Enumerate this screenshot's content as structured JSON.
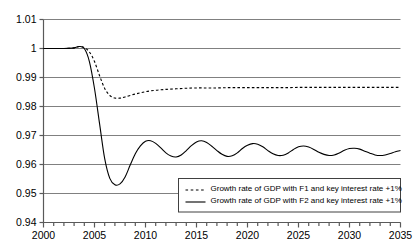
{
  "chart_data": {
    "type": "line",
    "title": "",
    "xlabel": "",
    "ylabel": "",
    "xlim": [
      2000,
      2035
    ],
    "ylim": [
      0.94,
      1.01
    ],
    "grid": true,
    "legend_position": "inside-bottom-right",
    "y_ticks": [
      "1.01",
      "1",
      "0.99",
      "0.98",
      "0.97",
      "0.96",
      "0.95",
      "0.94"
    ],
    "y_tick_values": [
      1.01,
      1.0,
      0.99,
      0.98,
      0.97,
      0.96,
      0.95,
      0.94
    ],
    "x_ticks": [
      "2000",
      "2005",
      "2010",
      "2015",
      "2020",
      "2025",
      "2030",
      "2035"
    ],
    "x_tick_values": [
      2000,
      2005,
      2010,
      2015,
      2020,
      2025,
      2030,
      2035
    ],
    "x_minor_tick_step": 1,
    "series": [
      {
        "name": "Growth rate of GDP with F1 and key interest rate +1%",
        "style": "dashed",
        "color": "#000000",
        "x": [
          2000,
          2001,
          2002,
          2003,
          2003.5,
          2004,
          2004.5,
          2005,
          2005.5,
          2006,
          2006.5,
          2007,
          2007.5,
          2008,
          2009,
          2010,
          2011,
          2012,
          2013,
          2014,
          2015,
          2016,
          2017,
          2018,
          2019,
          2020,
          2021,
          2022,
          2023,
          2024,
          2025,
          2026,
          2027,
          2028,
          2029,
          2030,
          2031,
          2032,
          2033,
          2034,
          2035
        ],
        "values": [
          1.0,
          1.0,
          1.0,
          1.0002,
          1.0007,
          1.0003,
          0.9988,
          0.9955,
          0.9906,
          0.9862,
          0.9838,
          0.9829,
          0.9829,
          0.9833,
          0.9843,
          0.9851,
          0.9856,
          0.9859,
          0.9861,
          0.9863,
          0.9864,
          0.9864,
          0.9864,
          0.9865,
          0.9865,
          0.9865,
          0.9865,
          0.9865,
          0.9865,
          0.9865,
          0.9866,
          0.9866,
          0.9866,
          0.9866,
          0.9866,
          0.9866,
          0.9866,
          0.9866,
          0.9866,
          0.9866,
          0.9866
        ]
      },
      {
        "name": "Growth rate of GDP with F2 and key interest rate +1%",
        "style": "solid",
        "color": "#000000",
        "x": [
          2000,
          2001,
          2002,
          2003,
          2003.5,
          2004,
          2004.5,
          2005,
          2005.5,
          2006,
          2006.5,
          2007,
          2007.5,
          2008,
          2008.5,
          2009,
          2009.5,
          2010,
          2010.5,
          2011,
          2011.5,
          2012,
          2012.5,
          2013,
          2013.5,
          2014,
          2014.5,
          2015,
          2015.5,
          2016,
          2016.5,
          2017,
          2017.5,
          2018,
          2018.5,
          2019,
          2019.5,
          2020,
          2020.5,
          2021,
          2021.5,
          2022,
          2022.5,
          2023,
          2023.5,
          2024,
          2024.5,
          2025,
          2025.5,
          2026,
          2026.5,
          2027,
          2027.5,
          2028,
          2028.5,
          2029,
          2029.5,
          2030,
          2030.5,
          2031,
          2031.5,
          2032,
          2032.5,
          2033,
          2033.5,
          2034,
          2034.5,
          2035
        ],
        "values": [
          1.0,
          1.0,
          1.0,
          1.0002,
          1.0007,
          1.0,
          0.9955,
          0.9862,
          0.974,
          0.962,
          0.9552,
          0.953,
          0.9533,
          0.9557,
          0.9598,
          0.9637,
          0.9664,
          0.968,
          0.9682,
          0.9673,
          0.9657,
          0.964,
          0.9629,
          0.9626,
          0.9633,
          0.9648,
          0.9665,
          0.9678,
          0.9682,
          0.9676,
          0.9663,
          0.9648,
          0.9635,
          0.9628,
          0.963,
          0.964,
          0.9655,
          0.9666,
          0.9672,
          0.967,
          0.9661,
          0.9648,
          0.9637,
          0.9631,
          0.9632,
          0.964,
          0.9652,
          0.9661,
          0.9664,
          0.966,
          0.9652,
          0.9642,
          0.9635,
          0.9631,
          0.9633,
          0.964,
          0.9649,
          0.9655,
          0.9656,
          0.9653,
          0.9646,
          0.9639,
          0.9633,
          0.9631,
          0.9633,
          0.9638,
          0.9644,
          0.9648
        ]
      }
    ],
    "legend": [
      {
        "label": "Growth rate of GDP with F1 and key interest rate +1%",
        "style": "dashed"
      },
      {
        "label": "Growth rate of GDP with F2 and key interest rate +1%",
        "style": "solid"
      }
    ]
  }
}
